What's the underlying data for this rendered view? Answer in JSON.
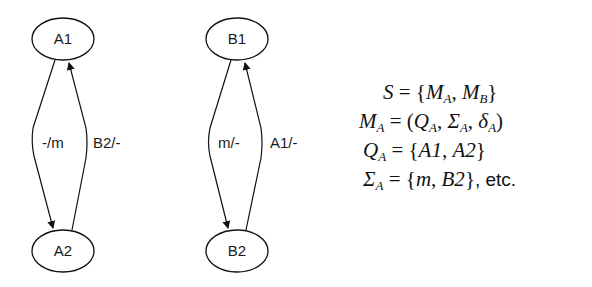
{
  "diagram": {
    "machine_a": {
      "states": [
        {
          "id": "A1",
          "label": "A1",
          "cx": 63,
          "cy": 39
        },
        {
          "id": "A2",
          "label": "A2",
          "cx": 63,
          "cy": 251
        }
      ],
      "transitions": [
        {
          "from": "A1",
          "to": "A2",
          "label": "-/m"
        },
        {
          "from": "A2",
          "to": "A1",
          "label": "B2/-"
        }
      ]
    },
    "machine_b": {
      "states": [
        {
          "id": "B1",
          "label": "B1",
          "cx": 237,
          "cy": 39
        },
        {
          "id": "B2",
          "label": "B2",
          "cx": 237,
          "cy": 251
        }
      ],
      "transitions": [
        {
          "from": "B1",
          "to": "B2",
          "label": "m/-"
        },
        {
          "from": "B2",
          "to": "B1",
          "label": "A1/-"
        }
      ]
    }
  },
  "formulas": {
    "line1": {
      "lhs": "S",
      "eq": " = {",
      "a": "M",
      "a_sub": "A",
      "sep": ", ",
      "b": "M",
      "b_sub": "B",
      "end": "}"
    },
    "line2": {
      "lhs": "M",
      "lhs_sub": "A",
      "eq": " = (",
      "a": "Q",
      "a_sub": "A",
      "sep1": ", ",
      "b": "Σ",
      "b_sub": "A",
      "sep2": ", ",
      "c": "δ",
      "c_sub": "A",
      "end": ")"
    },
    "line3": {
      "lhs": "Q",
      "lhs_sub": "A",
      "eq": " = {",
      "a": "A1",
      "sep": ", ",
      "b": "A2",
      "end": "}"
    },
    "line4": {
      "lhs": "Σ",
      "lhs_sub": "A",
      "eq": " = {",
      "a": "m",
      "sep": ", ",
      "b": "B2",
      "end": "}",
      "suffix": ", etc."
    }
  }
}
